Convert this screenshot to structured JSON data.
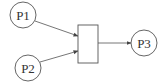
{
  "diagram": {
    "type": "petri-net",
    "stroke_color": "#555555",
    "line_color": "#666666",
    "places": [
      {
        "id": "P1",
        "label": "P1",
        "cx": 23,
        "cy": 15,
        "r": 13
      },
      {
        "id": "P2",
        "label": "P2",
        "cx": 28,
        "cy": 68,
        "r": 13
      },
      {
        "id": "P3",
        "label": "P3",
        "cx": 144,
        "cy": 43,
        "r": 13
      }
    ],
    "transitions": [
      {
        "id": "T1",
        "x": 78,
        "y": 25,
        "width": 20,
        "height": 38
      }
    ],
    "arcs": [
      {
        "from": "P1",
        "to": "T1"
      },
      {
        "from": "P2",
        "to": "T1"
      },
      {
        "from": "T1",
        "to": "P3"
      }
    ]
  }
}
